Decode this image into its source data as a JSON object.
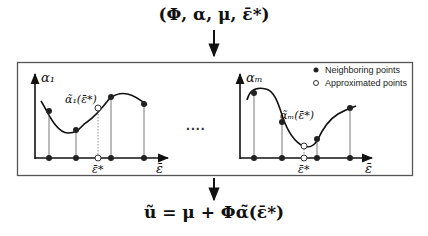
{
  "top_formula": "(Φ, α, μ, ε̄*)",
  "bottom_formula": "ũ = μ + Φα̃(ε̄*)",
  "ellipsis": "....",
  "legend": {
    "neighboring": "Neighboring points",
    "approximated": "Approximated points"
  },
  "left_plot": {
    "y_label": "α₁",
    "x_label": "ε̄",
    "x_star_label": "ε̄*",
    "approx_label": "α̃₁(ε̄*)"
  },
  "right_plot": {
    "y_label": "αₘ",
    "x_label": "ε̄",
    "x_star_label": "ε̄*",
    "approx_label": "α̃ₘ(ε̄*)"
  }
}
